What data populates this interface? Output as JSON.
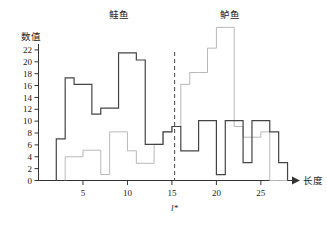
{
  "chart_data": {
    "type": "bar",
    "subtype": "overlaid-step-histogram",
    "title": "",
    "xlabel": "长度",
    "ylabel": "数值",
    "xlim": [
      0,
      28.5
    ],
    "ylim": [
      0,
      23
    ],
    "grid": false,
    "legend_position": "inline-annotation",
    "x_ticks": [
      5,
      10,
      15,
      20,
      25
    ],
    "y_ticks": [
      0,
      2,
      4,
      6,
      8,
      10,
      12,
      14,
      16,
      18,
      20,
      22
    ],
    "bin_width": 1,
    "annotations": [
      {
        "name": "salmon-class-label",
        "text": "鲑鱼",
        "x": 9,
        "y": 23.6
      },
      {
        "name": "seabass-class-label",
        "text": "鲈鱼",
        "x": 21.5,
        "y": 23.6
      },
      {
        "name": "threshold-label",
        "text": "l*",
        "x": 15.3,
        "y": -3.2
      }
    ],
    "threshold": {
      "name": "decision-boundary",
      "value": 15.3,
      "style": "dashed",
      "color": "#555555"
    },
    "series": [
      {
        "name": "鲑鱼",
        "label": "salmon",
        "color": "#444444",
        "bin_starts": [
          2,
          3,
          4,
          5,
          6,
          7,
          8,
          9,
          10,
          11,
          12,
          13,
          14,
          15,
          16,
          17,
          18,
          19,
          20,
          21,
          22,
          23,
          24,
          25,
          26,
          27
        ],
        "values": [
          7,
          17.3,
          16.2,
          16.2,
          11.2,
          12.2,
          12.2,
          21.5,
          21.5,
          20.3,
          6.1,
          6.1,
          8.2,
          9.1,
          5,
          5,
          10.1,
          10.1,
          1,
          10.1,
          10.1,
          3,
          10.1,
          10.1,
          8.2,
          3
        ]
      },
      {
        "name": "鲈鱼",
        "label": "sea bass",
        "color": "#b8b8b8",
        "bin_starts": [
          3,
          4,
          5,
          6,
          7,
          8,
          9,
          10,
          11,
          12,
          13,
          14,
          15,
          16,
          17,
          18,
          19,
          20,
          21,
          22,
          23,
          24,
          25,
          26,
          27
        ],
        "values": [
          4,
          4,
          5.1,
          5.1,
          1,
          8.2,
          8.2,
          5,
          2.9,
          2.9,
          6.1,
          8.2,
          9.1,
          16.2,
          18.2,
          18.2,
          22.3,
          25.8,
          25.8,
          9.1,
          7.3,
          7.3,
          8.2,
          0,
          0
        ]
      }
    ]
  },
  "axes": {
    "y_title": "数值",
    "x_title": "长度"
  }
}
